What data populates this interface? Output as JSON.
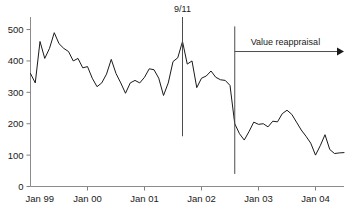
{
  "chart_data": {
    "type": "line",
    "title": "",
    "xlabel": "",
    "ylabel": "",
    "ylim": [
      0,
      540
    ],
    "xlim": [
      "Jan 99",
      "Jul 04"
    ],
    "grid": false,
    "legend": null,
    "y_ticks": [
      0,
      100,
      200,
      300,
      400,
      500
    ],
    "y_tick_labels": [
      "0",
      "100",
      "200",
      "300",
      "400",
      "500"
    ],
    "x_ticks": [
      "Jan 99",
      "Jan 00",
      "Jan 01",
      "Jan 02",
      "Jan 03",
      "Jan 04"
    ],
    "x_tick_labels": [
      "Jan 99",
      "Jan 00",
      "Jan 01",
      "Jan 02",
      "Jan 03",
      "Jan 04"
    ],
    "series": [
      {
        "name": "value",
        "x": [
          "Jan 99",
          "Feb 99",
          "Mar 99",
          "Apr 99",
          "May 99",
          "Jun 99",
          "Jul 99",
          "Aug 99",
          "Sep 99",
          "Oct 99",
          "Nov 99",
          "Dec 99",
          "Jan 00",
          "Feb 00",
          "Mar 00",
          "Apr 00",
          "May 00",
          "Jun 00",
          "Jul 00",
          "Aug 00",
          "Sep 00",
          "Oct 00",
          "Nov 00",
          "Dec 00",
          "Jan 01",
          "Feb 01",
          "Mar 01",
          "Apr 01",
          "May 01",
          "Jun 01",
          "Jul 01",
          "Aug 01",
          "Sep 01",
          "Oct 01",
          "Nov 01",
          "Dec 01",
          "Jan 02",
          "Feb 02",
          "Mar 02",
          "Apr 02",
          "May 02",
          "Jun 02",
          "Jul 02",
          "Aug 02",
          "Sep 02",
          "Oct 02",
          "Nov 02",
          "Dec 02",
          "Jan 03",
          "Feb 03",
          "Mar 03",
          "Apr 03",
          "May 03",
          "Jun 03",
          "Jul 03",
          "Aug 03",
          "Sep 03",
          "Oct 03",
          "Nov 03",
          "Dec 03",
          "Jan 04",
          "Feb 04",
          "Mar 04",
          "Apr 04",
          "May 04",
          "Jun 04",
          "Jul 04"
        ],
        "values": [
          360,
          330,
          462,
          408,
          440,
          490,
          455,
          440,
          430,
          400,
          408,
          378,
          382,
          345,
          318,
          330,
          358,
          405,
          360,
          330,
          297,
          330,
          338,
          330,
          348,
          375,
          372,
          345,
          290,
          330,
          398,
          410,
          462,
          390,
          400,
          315,
          345,
          352,
          368,
          348,
          340,
          338,
          322,
          200,
          168,
          148,
          175,
          205,
          198,
          200,
          190,
          208,
          206,
          232,
          243,
          230,
          205,
          180,
          160,
          138,
          100,
          130,
          165,
          118,
          105,
          107,
          108
        ]
      }
    ],
    "annotations": [
      {
        "name": "nine-eleven",
        "label": "9/11",
        "type": "vertical-line-with-label",
        "x": "Sep 01",
        "y_top": 540,
        "y_bottom": 160
      },
      {
        "name": "value-reappraisal",
        "label": "Value reappraisal",
        "type": "vertical-line-plus-arrow",
        "x": "Aug 02",
        "y_top": 510,
        "y_bottom": 40,
        "arrow_y": 430,
        "arrow_to_x": "Jul 04",
        "arrow_direction": "right"
      }
    ],
    "colors": {
      "line": "#1a1a1a",
      "axis": "#808080",
      "annotation": "#4d4d4d",
      "text": "#1a1a1a",
      "background": "#ffffff"
    }
  },
  "figure": {
    "caption": ""
  }
}
